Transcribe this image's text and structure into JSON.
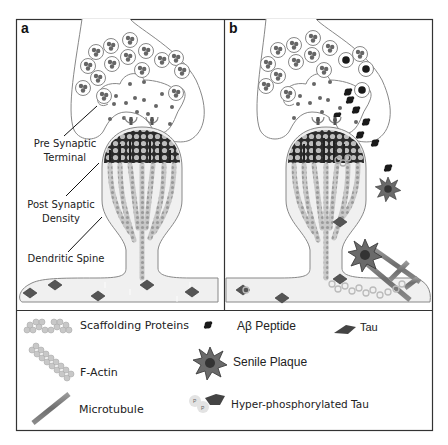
{
  "figure": {
    "type": "schematic",
    "panels": [
      {
        "label": "a",
        "title": "Healthy synapse"
      },
      {
        "label": "b",
        "title": "Alzheimer's disease synapse"
      }
    ],
    "annotations": {
      "pre_synaptic_line1": "Pre Synaptic",
      "pre_synaptic_line2": "Terminal",
      "post_synaptic_line1": "Post Synaptic",
      "post_synaptic_line2": "Density",
      "dendritic_spine": "Dendritic Spine"
    },
    "legend": {
      "scaffolding": "Scaffolding Proteins",
      "factin": "F-Actin",
      "microtubule": "Microtubule",
      "abeta": "Aβ Peptide",
      "plaque": "Senile Plaque",
      "hyperp_tau": "Hyper-phosphorylated Tau",
      "tau": "Tau"
    },
    "colors": {
      "outline": "#888888",
      "frame": "#333333",
      "psd_dark": "#2b2b2b",
      "scaffold": "#b8b8b8",
      "microtubule": "#7a7a7a",
      "tau": "#555555",
      "abeta": "#1a1a1a",
      "vesicle": "#6a6a6a"
    }
  }
}
